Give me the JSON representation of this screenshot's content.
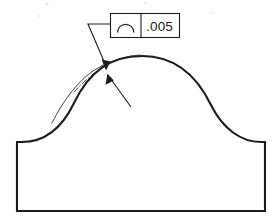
{
  "drawing": {
    "kind": "engineering-drawing",
    "title": "Profile of a Line Tolerance Callout",
    "background_color": "#ffffff",
    "line_color": "#1d1d1d",
    "thin_line_color": "#2b2b2b",
    "canvas": {
      "width": 278,
      "height": 221
    }
  },
  "feature_control_frame": {
    "name": "profile-of-a-line-callout",
    "symbol_name": "profile-of-a-line-icon",
    "symbol_description": "open arc",
    "tolerance_value": ".005",
    "frame": {
      "x": 110,
      "y": 13,
      "width": 70,
      "height": 25
    },
    "divider_x": 141,
    "border_color": "#1d1d1d"
  },
  "leaders": [
    {
      "name": "tolerance-zone-upper-leader",
      "from_label": "feature-control-frame",
      "points": "110,24 88,24 106,66",
      "arrow_at": {
        "x": 106,
        "y": 68
      },
      "arrow_angle_deg": 67
    },
    {
      "name": "tolerance-zone-lower-leader",
      "from_label": "surface-profile",
      "points": "131,107 110,78",
      "arrow_at": {
        "x": 108,
        "y": 75
      },
      "arrow_angle_deg": 234
    }
  ],
  "part_profile": {
    "name": "part-outline",
    "base_left_x": 17,
    "base_right_x": 265,
    "base_top_y": 142,
    "base_bottom_y": 211,
    "dome_apex": {
      "x": 142,
      "y": 60
    },
    "path": "M 17,211 L 17,142 L 22,142 C 44,142 62,128 74,103 C 89,72 110,56 142,56 C 174,56 196,74 211,105 C 223,129 241,142 261,142 L 265,142 L 265,211 Z"
  },
  "tolerance_zone": {
    "name": "tolerance-zone-boundary",
    "outer_offset_path": "M 52,123 C 64,99 80,78 98,68 C 112,60 126,56 140,55",
    "phantom_path": "M 74,92 C 84,81 94,73 104,67",
    "phantom_dash": "6 2 1.6 2"
  },
  "artifacts": [
    {
      "name": "scan-speck",
      "x": 47,
      "y": 4,
      "r": 1.6
    },
    {
      "name": "scan-speck",
      "x": 145,
      "y": 3,
      "r": 1.4
    },
    {
      "name": "scan-speck",
      "x": 39,
      "y": 16,
      "r": 1.2
    },
    {
      "name": "scan-speck",
      "x": 213,
      "y": 13,
      "r": 1.0
    }
  ]
}
